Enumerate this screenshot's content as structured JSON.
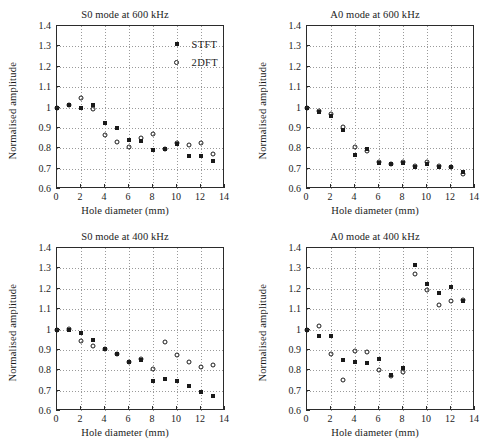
{
  "figure": {
    "panel_count": 4,
    "marker_names": {
      "stft": "filled-square-marker",
      "dft": "open-circle-marker"
    }
  },
  "legend": {
    "entries": [
      {
        "label": "STFT",
        "marker": "filled-square"
      },
      {
        "label": "2DFT",
        "marker": "open-circle"
      }
    ]
  },
  "axis": {
    "xlabel": "Hole diameter (mm)",
    "ylabel": "Normalised amplitude",
    "xticks": [
      "0",
      "2",
      "4",
      "6",
      "8",
      "10",
      "12",
      "14"
    ],
    "xtick_values": [
      0,
      2,
      4,
      6,
      8,
      10,
      12,
      14
    ],
    "yticks": [
      "0.6",
      "0.7",
      "0.8",
      "0.9",
      "1",
      "1.1",
      "1.2",
      "1.3",
      "1.4"
    ],
    "ytick_values": [
      0.6,
      0.7,
      0.8,
      0.9,
      1.0,
      1.1,
      1.2,
      1.3,
      1.4
    ],
    "xlim": [
      0,
      14
    ],
    "ylim": [
      0.6,
      1.4
    ],
    "grid": "dotted"
  },
  "chart_data": [
    {
      "type": "scatter",
      "panel": "top-left",
      "title": "S0 mode at 600 kHz",
      "xlabel": "Hole diameter (mm)",
      "ylabel": "Normalised amplitude",
      "xlim": [
        0,
        14
      ],
      "ylim": [
        0.6,
        1.4
      ],
      "grid": true,
      "legend_position": "upper-right",
      "series": [
        {
          "name": "STFT",
          "marker": "filled-square",
          "x": [
            0,
            1,
            2,
            3,
            4,
            5,
            6,
            7,
            8,
            9,
            10,
            11,
            12,
            13
          ],
          "y": [
            1.0,
            1.012,
            0.997,
            1.013,
            0.925,
            0.901,
            0.84,
            0.838,
            0.793,
            0.796,
            0.822,
            0.761,
            0.763,
            0.737
          ]
        },
        {
          "name": "2DFT",
          "marker": "open-circle",
          "x": [
            0,
            1,
            2,
            3,
            4,
            5,
            6,
            7,
            8,
            9,
            10,
            11,
            12,
            13
          ],
          "y": [
            1.0,
            1.014,
            1.045,
            0.992,
            0.864,
            0.831,
            0.805,
            0.849,
            0.868,
            0.796,
            0.827,
            0.814,
            0.828,
            0.771
          ]
        }
      ]
    },
    {
      "type": "scatter",
      "panel": "top-right",
      "title": "A0 mode at 600 kHz",
      "xlabel": "Hole diameter (mm)",
      "ylabel": "Normalised amplitude",
      "xlim": [
        0,
        14
      ],
      "ylim": [
        0.6,
        1.4
      ],
      "grid": true,
      "legend_position": "none",
      "series": [
        {
          "name": "STFT",
          "marker": "filled-square",
          "x": [
            0,
            1,
            2,
            3,
            4,
            5,
            6,
            7,
            8,
            9,
            10,
            11,
            12,
            13
          ],
          "y": [
            1.0,
            0.978,
            0.957,
            0.888,
            0.766,
            0.796,
            0.729,
            0.722,
            0.727,
            0.706,
            0.722,
            0.709,
            0.709,
            0.681
          ]
        },
        {
          "name": "2DFT",
          "marker": "open-circle",
          "x": [
            0,
            1,
            2,
            3,
            4,
            5,
            6,
            7,
            8,
            9,
            10,
            11,
            12,
            13
          ],
          "y": [
            1.0,
            0.982,
            0.966,
            0.903,
            0.806,
            0.786,
            0.733,
            0.724,
            0.731,
            0.711,
            0.733,
            0.712,
            0.708,
            0.673
          ]
        }
      ]
    },
    {
      "type": "scatter",
      "panel": "bottom-left",
      "title": "S0 mode at 400 kHz",
      "xlabel": "Hole diameter (mm)",
      "ylabel": "Normalised amplitude",
      "xlim": [
        0,
        14
      ],
      "ylim": [
        0.6,
        1.4
      ],
      "grid": true,
      "legend_position": "none",
      "series": [
        {
          "name": "STFT",
          "marker": "filled-square",
          "x": [
            0,
            1,
            2,
            3,
            4,
            5,
            6,
            7,
            8,
            9,
            10,
            11,
            12,
            13
          ],
          "y": [
            1.0,
            0.999,
            0.982,
            0.95,
            0.903,
            0.881,
            0.84,
            0.851,
            0.748,
            0.757,
            0.748,
            0.723,
            0.695,
            0.672
          ]
        },
        {
          "name": "2DFT",
          "marker": "open-circle",
          "x": [
            0,
            1,
            2,
            3,
            4,
            5,
            6,
            7,
            8,
            9,
            10,
            11,
            12,
            13
          ],
          "y": [
            1.0,
            1.002,
            0.944,
            0.92,
            0.905,
            0.879,
            0.841,
            0.854,
            0.806,
            0.941,
            0.875,
            0.841,
            0.818,
            0.824
          ]
        }
      ]
    },
    {
      "type": "scatter",
      "panel": "bottom-right",
      "title": "A0 mode at 400 kHz",
      "xlabel": "Hole diameter (mm)",
      "ylabel": "Normalised amplitude",
      "xlim": [
        0,
        14
      ],
      "ylim": [
        0.6,
        1.4
      ],
      "grid": true,
      "legend_position": "none",
      "series": [
        {
          "name": "STFT",
          "marker": "filled-square",
          "x": [
            0,
            1,
            2,
            3,
            4,
            5,
            6,
            7,
            8,
            9,
            10,
            11,
            12,
            13
          ],
          "y": [
            1.0,
            0.968,
            0.968,
            0.849,
            0.84,
            0.834,
            0.855,
            0.777,
            0.809,
            1.319,
            1.223,
            1.178,
            1.209,
            1.138
          ]
        },
        {
          "name": "2DFT",
          "marker": "open-circle",
          "x": [
            0,
            1,
            2,
            3,
            4,
            5,
            6,
            7,
            8,
            9,
            10,
            11,
            12,
            13
          ],
          "y": [
            1.0,
            1.017,
            0.88,
            0.753,
            0.894,
            0.888,
            0.802,
            0.771,
            0.792,
            1.27,
            1.196,
            1.12,
            1.142,
            1.143
          ]
        }
      ]
    }
  ]
}
